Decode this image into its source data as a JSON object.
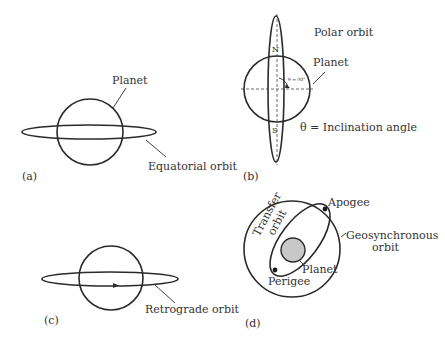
{
  "figure": {
    "panels": [
      {
        "id": "a",
        "label": "(a)",
        "annotations": {
          "planet": "Planet",
          "orbit": "Equatorial orbit"
        }
      },
      {
        "id": "b",
        "label": "(b)",
        "annotations": {
          "orbit": "Polar orbit",
          "planet": "Planet",
          "north": "N",
          "south": "S",
          "angle": "θ = 90°",
          "legend": "θ = Inclination angle"
        }
      },
      {
        "id": "c",
        "label": "(c)",
        "annotations": {
          "orbit": "Retrograde orbit"
        }
      },
      {
        "id": "d",
        "label": "(d)",
        "annotations": {
          "transfer_line1": "Transfer",
          "transfer_line2": "orbit",
          "apogee": "Apogee",
          "perigee": "Perigee",
          "planet": "Planet",
          "geo_line1": "Geosynchronous",
          "geo_line2": "orbit"
        }
      }
    ],
    "colors": {
      "line": "#2a2a2a",
      "text": "#333333",
      "planet_fill": "#c8c8c8"
    }
  }
}
